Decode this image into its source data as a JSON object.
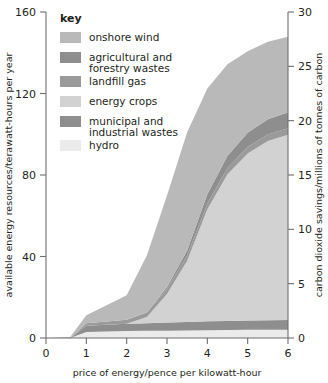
{
  "chart_data": {
    "type": "area",
    "stacked": true,
    "title": "",
    "xlabel": "price of energy/pence per kilowatt-hour",
    "ylabel": "available energy resources/terawatt-hours per year",
    "ylabel_right": "carbon dioxide savings/millions of tonnes of carbon",
    "xlim": [
      0,
      6
    ],
    "ylim": [
      0,
      160
    ],
    "ylim_right": [
      0,
      30
    ],
    "xticks": [
      0,
      1,
      2,
      3,
      4,
      5,
      6
    ],
    "yticks": [
      0,
      40,
      80,
      120,
      160
    ],
    "yticks_right": [
      0,
      5,
      10,
      15,
      20,
      25,
      30
    ],
    "grid": false,
    "legend_position": "inside-top-left",
    "legend_title": "key",
    "x": [
      0,
      0.6,
      1.0,
      1.5,
      2.0,
      2.5,
      3.0,
      3.5,
      4.0,
      4.5,
      5.0,
      5.5,
      6.0
    ],
    "series": [
      {
        "name": "hydro",
        "color": "#ebebeb",
        "values": [
          0,
          0,
          3.0,
          3.2,
          3.4,
          3.5,
          3.6,
          3.7,
          3.8,
          3.9,
          4.0,
          4.0,
          4.0
        ]
      },
      {
        "name": "municipal and industrial wastes",
        "color": "#8e8e8e",
        "values": [
          0,
          0,
          3.0,
          3.3,
          3.6,
          3.8,
          4.0,
          4.2,
          4.4,
          4.5,
          4.6,
          4.7,
          4.8
        ]
      },
      {
        "name": "energy crops",
        "color": "#d2d2d2",
        "values": [
          0,
          0,
          0,
          0,
          0,
          3.0,
          14.0,
          30.0,
          55.0,
          72.0,
          82.0,
          88.0,
          91.0
        ]
      },
      {
        "name": "landfill gas",
        "color": "#9a9a9a",
        "values": [
          0,
          0,
          1.2,
          1.6,
          2.0,
          2.2,
          2.4,
          2.6,
          2.8,
          3.0,
          3.1,
          3.2,
          3.2
        ]
      },
      {
        "name": "agricultural and forestry wastes",
        "color": "#8e8e8e",
        "values": [
          0,
          0,
          0,
          0,
          0,
          0,
          1.0,
          2.5,
          4.5,
          6.0,
          7.0,
          7.5,
          7.8
        ]
      },
      {
        "name": "onshore wind",
        "color": "#b9b9b9",
        "values": [
          0,
          0.5,
          4.0,
          8.0,
          12.0,
          28.0,
          45.0,
          58.0,
          52.0,
          45.0,
          40.0,
          38.0,
          37.0
        ]
      }
    ],
    "legend_entries": [
      {
        "label": "onshore wind",
        "color": "#b9b9b9"
      },
      {
        "label": "agricultural and forestry wastes",
        "color": "#8e8e8e"
      },
      {
        "label": "landfill gas",
        "color": "#9a9a9a"
      },
      {
        "label": "energy crops",
        "color": "#d2d2d2"
      },
      {
        "label": "municipal and industrial wastes",
        "color": "#8e8e8e"
      },
      {
        "label": "hydro",
        "color": "#ebebeb"
      }
    ]
  },
  "legend": {
    "title": "key",
    "items": [
      {
        "line1": "onshore wind",
        "line2": ""
      },
      {
        "line1": "agricultural and",
        "line2": "forestry wastes"
      },
      {
        "line1": "landfill gas",
        "line2": ""
      },
      {
        "line1": "energy crops",
        "line2": ""
      },
      {
        "line1": "municipal and",
        "line2": "industrial wastes"
      },
      {
        "line1": "hydro",
        "line2": ""
      }
    ]
  },
  "axes": {
    "x_title": "price of energy/pence per kilowatt-hour",
    "y_left_title": "available energy resources/terawatt-hours per year",
    "y_right_title": "carbon dioxide savings/millions of tonnes of carbon",
    "x_tick_labels": [
      "0",
      "1",
      "2",
      "3",
      "4",
      "5",
      "6"
    ],
    "y_left_tick_labels": [
      "0",
      "40",
      "80",
      "120",
      "160"
    ],
    "y_right_tick_labels": [
      "0",
      "5",
      "10",
      "15",
      "20",
      "25",
      "30"
    ]
  }
}
